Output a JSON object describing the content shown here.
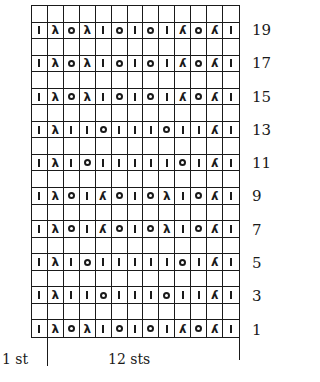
{
  "chart": {
    "columns": 13,
    "rows_total": 20,
    "symbols": {
      "k": {
        "name": "knit",
        "glyph": ""
      },
      "o": {
        "name": "yarn-over",
        "glyph": ""
      },
      "l": {
        "name": "left-leaning-decrease",
        "glyph": "λ"
      },
      "r": {
        "name": "right-leaning-decrease",
        "glyph": "λ"
      },
      "e": {
        "name": "empty",
        "glyph": ""
      }
    },
    "rows": [
      {
        "number": "",
        "cells": [
          "e",
          "e",
          "e",
          "e",
          "e",
          "e",
          "e",
          "e",
          "e",
          "e",
          "e",
          "e",
          "e"
        ]
      },
      {
        "number": "19",
        "cells": [
          "k",
          "l",
          "o",
          "l",
          "k",
          "o",
          "k",
          "o",
          "k",
          "r",
          "o",
          "r",
          "k"
        ]
      },
      {
        "number": "",
        "cells": [
          "e",
          "e",
          "e",
          "e",
          "e",
          "e",
          "e",
          "e",
          "e",
          "e",
          "e",
          "e",
          "e"
        ]
      },
      {
        "number": "17",
        "cells": [
          "k",
          "l",
          "o",
          "l",
          "k",
          "o",
          "k",
          "o",
          "k",
          "r",
          "o",
          "r",
          "k"
        ]
      },
      {
        "number": "",
        "cells": [
          "e",
          "e",
          "e",
          "e",
          "e",
          "e",
          "e",
          "e",
          "e",
          "e",
          "e",
          "e",
          "e"
        ]
      },
      {
        "number": "15",
        "cells": [
          "k",
          "l",
          "o",
          "l",
          "k",
          "o",
          "k",
          "o",
          "k",
          "r",
          "o",
          "r",
          "k"
        ]
      },
      {
        "number": "",
        "cells": [
          "e",
          "e",
          "e",
          "e",
          "e",
          "e",
          "e",
          "e",
          "e",
          "e",
          "e",
          "e",
          "e"
        ]
      },
      {
        "number": "13",
        "cells": [
          "k",
          "l",
          "k",
          "k",
          "o",
          "k",
          "k",
          "k",
          "o",
          "k",
          "k",
          "r",
          "k"
        ]
      },
      {
        "number": "",
        "cells": [
          "e",
          "e",
          "e",
          "e",
          "e",
          "e",
          "e",
          "e",
          "e",
          "e",
          "e",
          "e",
          "e"
        ]
      },
      {
        "number": "11",
        "cells": [
          "k",
          "l",
          "k",
          "o",
          "k",
          "k",
          "k",
          "k",
          "k",
          "o",
          "k",
          "r",
          "k"
        ]
      },
      {
        "number": "",
        "cells": [
          "e",
          "e",
          "e",
          "e",
          "e",
          "e",
          "e",
          "e",
          "e",
          "e",
          "e",
          "e",
          "e"
        ]
      },
      {
        "number": "9",
        "cells": [
          "k",
          "l",
          "o",
          "k",
          "r",
          "o",
          "k",
          "o",
          "l",
          "k",
          "o",
          "r",
          "k"
        ]
      },
      {
        "number": "",
        "cells": [
          "e",
          "e",
          "e",
          "e",
          "e",
          "e",
          "e",
          "e",
          "e",
          "e",
          "e",
          "e",
          "e"
        ]
      },
      {
        "number": "7",
        "cells": [
          "k",
          "l",
          "o",
          "k",
          "r",
          "o",
          "k",
          "o",
          "l",
          "k",
          "o",
          "r",
          "k"
        ]
      },
      {
        "number": "",
        "cells": [
          "e",
          "e",
          "e",
          "e",
          "e",
          "e",
          "e",
          "e",
          "e",
          "e",
          "e",
          "e",
          "e"
        ]
      },
      {
        "number": "5",
        "cells": [
          "k",
          "l",
          "k",
          "o",
          "k",
          "k",
          "k",
          "k",
          "k",
          "o",
          "k",
          "r",
          "k"
        ]
      },
      {
        "number": "",
        "cells": [
          "e",
          "e",
          "e",
          "e",
          "e",
          "e",
          "e",
          "e",
          "e",
          "e",
          "e",
          "e",
          "e"
        ]
      },
      {
        "number": "3",
        "cells": [
          "k",
          "l",
          "k",
          "k",
          "o",
          "k",
          "k",
          "k",
          "o",
          "k",
          "k",
          "r",
          "k"
        ]
      },
      {
        "number": "",
        "cells": [
          "e",
          "e",
          "e",
          "e",
          "e",
          "e",
          "e",
          "e",
          "e",
          "e",
          "e",
          "e",
          "e"
        ]
      },
      {
        "number": "1",
        "cells": [
          "k",
          "l",
          "o",
          "l",
          "k",
          "o",
          "k",
          "o",
          "k",
          "r",
          "o",
          "r",
          "k"
        ]
      }
    ]
  },
  "legend": {
    "edge_label": "1 st",
    "repeat_label": "12 sts"
  }
}
